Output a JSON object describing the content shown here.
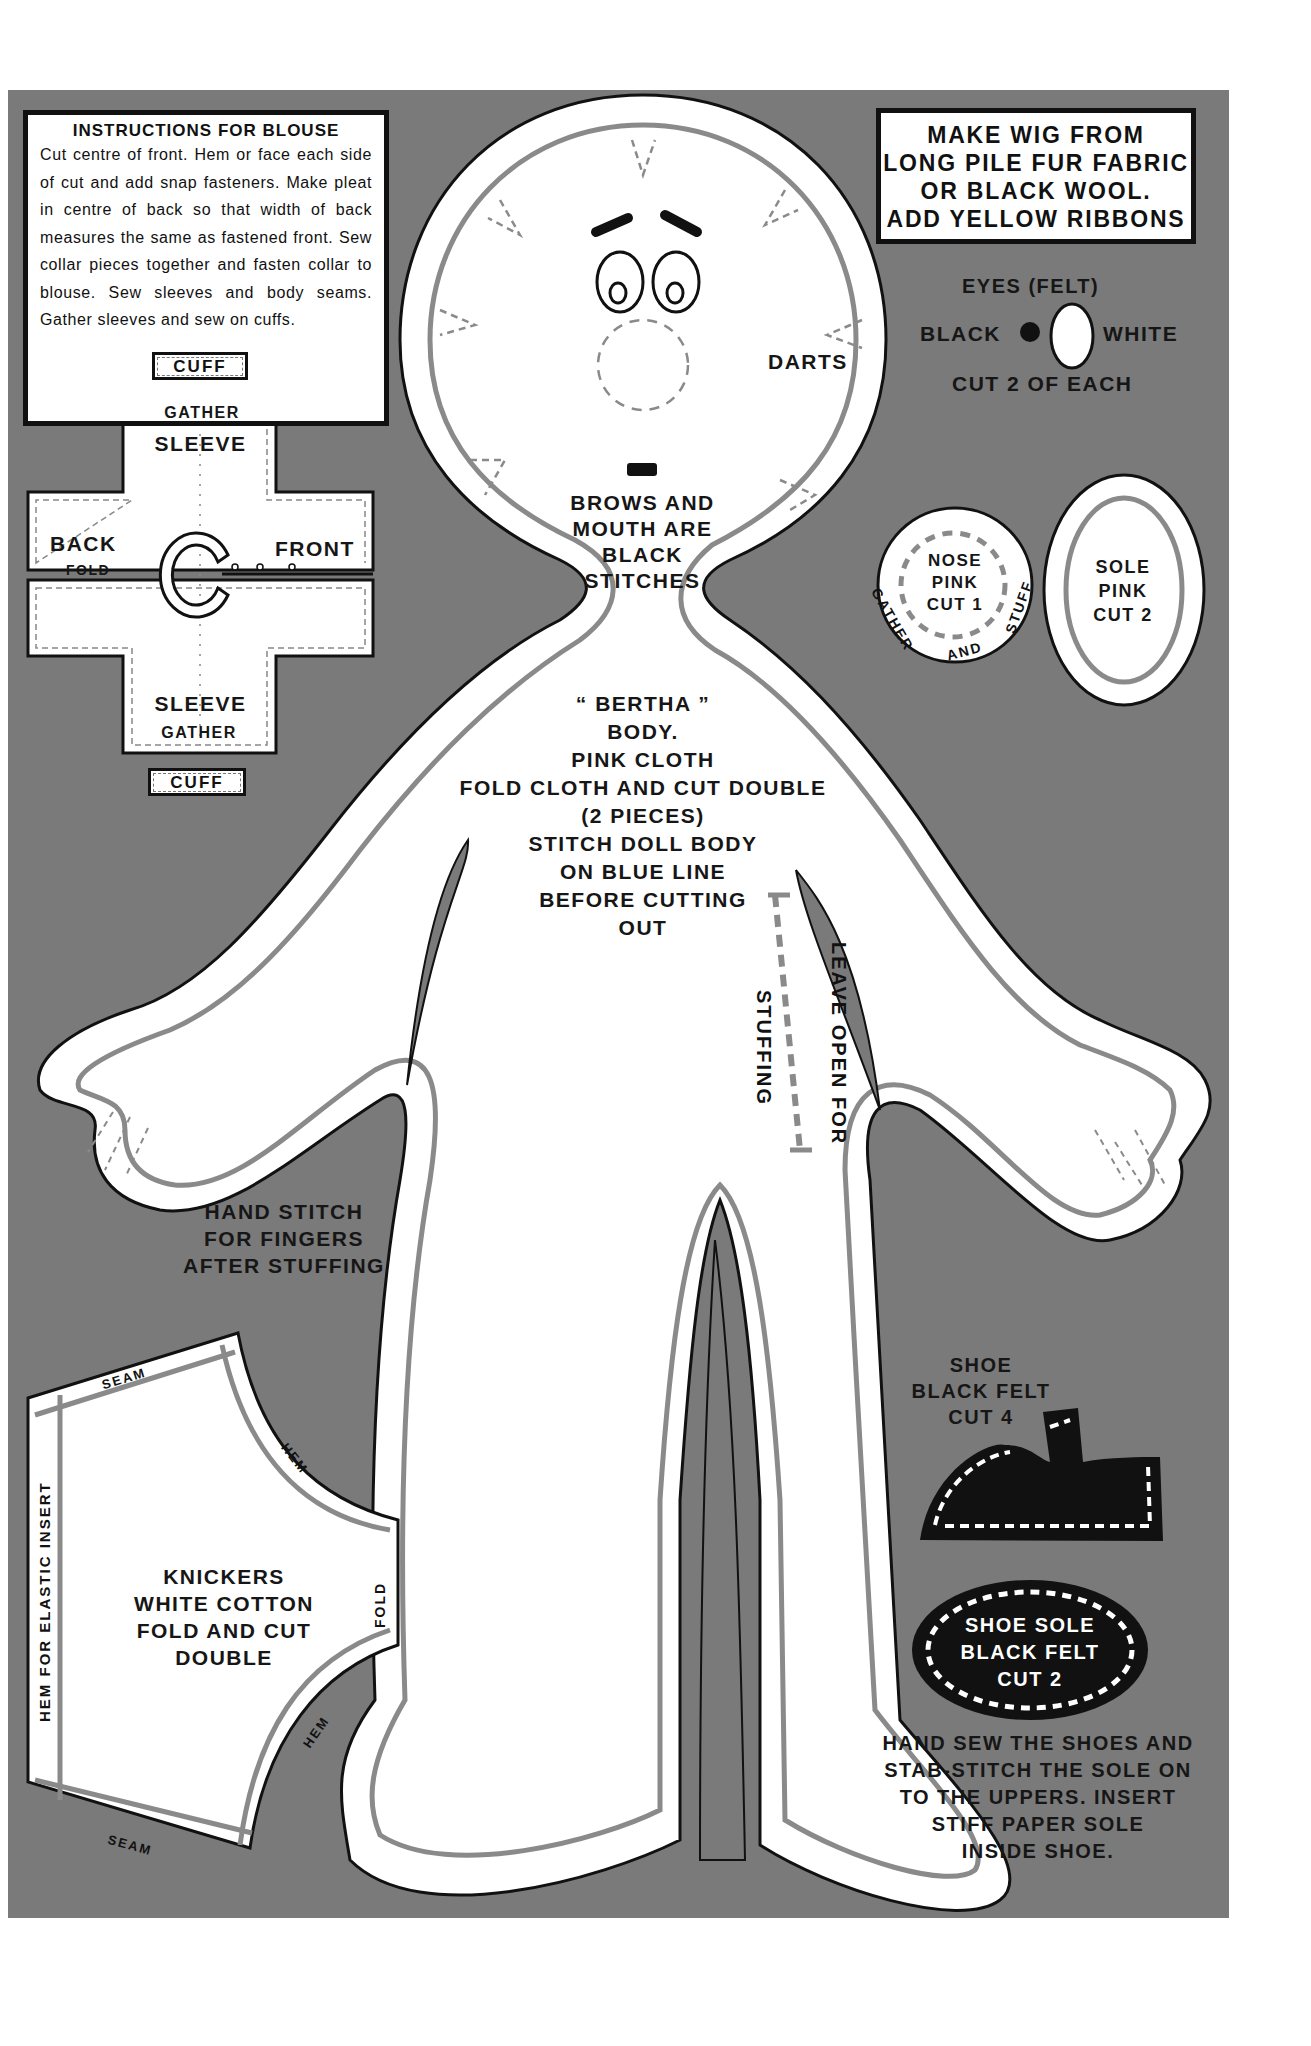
{
  "blouse_instructions": {
    "title": "INSTRUCTIONS FOR BLOUSE",
    "text": "Cut centre of front. Hem or face each side of cut and add snap fasteners. Make pleat in centre of back so that width of back measures the same as fastened front. Sew collar pieces together and fasten collar to blouse. Sew sleeves and body seams. Gather sleeves and sew on cuffs."
  },
  "blouse_pattern": {
    "cuff_top": "CUFF",
    "cuff_bottom": "CUFF",
    "gather_top": "GATHER",
    "sleeve_top": "SLEEVE",
    "back": "BACK",
    "fold": "FOLD",
    "front": "FRONT",
    "sleeve_bottom": "SLEEVE",
    "gather_bottom": "GATHER"
  },
  "wig_box": {
    "lines": [
      "MAKE WIG FROM",
      "LONG PILE FUR FABRIC",
      "OR BLACK WOOL.",
      "ADD YELLOW RIBBONS"
    ]
  },
  "eyes": {
    "title": "EYES (FELT)",
    "black": "BLACK",
    "white": "WHITE",
    "cut": "CUT 2 OF EACH"
  },
  "head": {
    "darts": "DARTS",
    "brows_note": [
      "BROWS AND",
      "MOUTH ARE",
      "BLACK",
      "STITCHES"
    ]
  },
  "nose": {
    "lines": [
      "NOSE",
      "PINK",
      "CUT 1"
    ],
    "arc_left": "GATHER",
    "arc_bottom": "AND",
    "arc_right": "STUFF"
  },
  "sole": {
    "lines": [
      "SOLE",
      "PINK",
      "CUT 2"
    ]
  },
  "body": {
    "lines": [
      "“ BERTHA ”",
      "BODY.",
      "PINK CLOTH",
      "FOLD CLOTH AND CUT DOUBLE",
      "(2 PIECES)",
      "STITCH DOLL BODY",
      "ON BLUE LINE",
      "BEFORE CUTTING",
      "OUT"
    ],
    "leave_open": "LEAVE OPEN FOR",
    "stuffing": "STUFFING"
  },
  "hand_note": {
    "lines": [
      "HAND STITCH",
      "FOR FINGERS",
      "AFTER STUFFING"
    ]
  },
  "knickers": {
    "lines": [
      "KNICKERS",
      "WHITE COTTON",
      "FOLD AND CUT",
      "DOUBLE"
    ],
    "seam_top": "SEAM",
    "seam_bottom": "SEAM",
    "hem_top": "HEM",
    "hem_bottom": "HEM",
    "fold": "FOLD",
    "elastic": "HEM FOR ELASTIC INSERT"
  },
  "shoe": {
    "lines": [
      "SHOE",
      "BLACK FELT",
      "CUT 4"
    ]
  },
  "shoe_sole": {
    "lines": [
      "SHOE SOLE",
      "BLACK FELT",
      "CUT 2"
    ]
  },
  "shoe_note": {
    "lines": [
      "HAND SEW THE SHOES AND",
      "STAB-STITCH THE SOLE ON",
      "TO THE UPPERS. INSERT",
      "STIFF PAPER SOLE",
      "INSIDE  SHOE."
    ]
  },
  "colors": {
    "panel": "#7a7a7a",
    "stitch_line": "#8a8a8a",
    "outline": "#111111",
    "fabric": "#ffffff"
  }
}
